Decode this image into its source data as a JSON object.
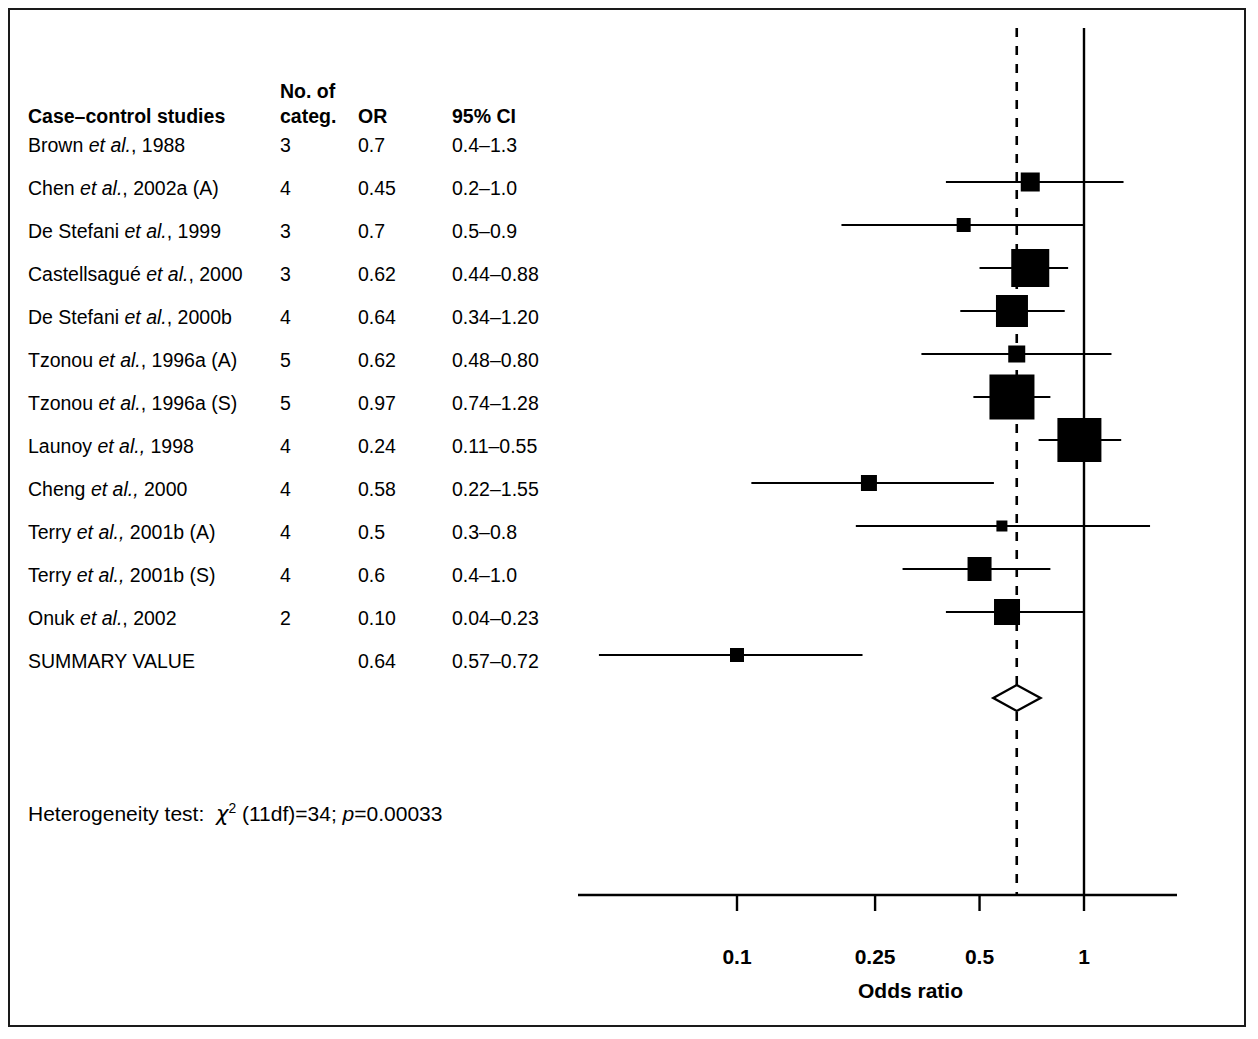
{
  "figure": {
    "table_headers": {
      "study": "Case–control studies",
      "categories_line1": "No. of",
      "categories_line2": "categ.",
      "or": "OR",
      "ci": "95% CI"
    },
    "heterogeneity": {
      "prefix": "Heterogeneity test:",
      "chi": "χ",
      "chi_exp": "2",
      "df": "(11df)=34;",
      "p_italic": "p",
      "p_value": "=0.00033"
    },
    "summary_row_label": "SUMMARY VALUE"
  },
  "chart_data": {
    "type": "forest",
    "title": "",
    "xlabel": "Odds ratio",
    "ylabel": "",
    "xscale": "log",
    "xlim": [
      0.065,
      1.35
    ],
    "xticks": [
      0.1,
      0.25,
      0.5,
      1
    ],
    "xtick_labels": [
      "0.1",
      "0.25",
      "0.5",
      "1"
    ],
    "grid": false,
    "reference_line": 1,
    "summary_line": 0.64,
    "columns": [
      "Case–control studies",
      "No. of categ.",
      "OR",
      "95% CI"
    ],
    "rows": [
      {
        "study": "Brown ",
        "study_italic": "et al.",
        "study_tail": ", 1988",
        "categ": "3",
        "or": "0.7",
        "ci": "0.4–1.3",
        "or_value": 0.7,
        "ci_low": 0.4,
        "ci_high": 1.3,
        "marker_size": 19
      },
      {
        "study": "Chen ",
        "study_italic": "et al.",
        "study_tail": ", 2002a (A)",
        "categ": "4",
        "or": "0.45",
        "ci": "0.2–1.0",
        "or_value": 0.45,
        "ci_low": 0.2,
        "ci_high": 1.0,
        "marker_size": 14
      },
      {
        "study": "De Stefani ",
        "study_italic": "et al.",
        "study_tail": ", 1999",
        "categ": "3",
        "or": "0.7",
        "ci": "0.5–0.9",
        "or_value": 0.7,
        "ci_low": 0.5,
        "ci_high": 0.9,
        "marker_size": 38
      },
      {
        "study": "Castellsagué ",
        "study_italic": "et al.",
        "study_tail": ", 2000",
        "categ": "3",
        "or": "0.62",
        "ci": "0.44–0.88",
        "or_value": 0.62,
        "ci_low": 0.44,
        "ci_high": 0.88,
        "marker_size": 32
      },
      {
        "study": "De Stefani ",
        "study_italic": "et al.",
        "study_tail": ", 2000b",
        "categ": "4",
        "or": "0.64",
        "ci": "0.34–1.20",
        "or_value": 0.64,
        "ci_low": 0.34,
        "ci_high": 1.2,
        "marker_size": 17
      },
      {
        "study": "Tzonou ",
        "study_italic": "et al.",
        "study_tail": ", 1996a (A)",
        "categ": "5",
        "or": "0.62",
        "ci": "0.48–0.80",
        "or_value": 0.62,
        "ci_low": 0.48,
        "ci_high": 0.8,
        "marker_size": 45
      },
      {
        "study": "Tzonou ",
        "study_italic": "et al.",
        "study_tail": ", 1996a (S)",
        "categ": "5",
        "or": "0.97",
        "ci": "0.74–1.28",
        "or_value": 0.97,
        "ci_low": 0.74,
        "ci_high": 1.28,
        "marker_size": 44
      },
      {
        "study": "Launoy ",
        "study_italic": "et al.,",
        "study_tail": " 1998",
        "categ": "4",
        "or": "0.24",
        "ci": "0.11–0.55",
        "or_value": 0.24,
        "ci_low": 0.11,
        "ci_high": 0.55,
        "marker_size": 16
      },
      {
        "study": "Cheng ",
        "study_italic": "et al.,",
        "study_tail": " 2000",
        "categ": "4",
        "or": "0.58",
        "ci": "0.22–1.55",
        "or_value": 0.58,
        "ci_low": 0.22,
        "ci_high": 1.55,
        "marker_size": 11
      },
      {
        "study": "Terry ",
        "study_italic": "et al.,",
        "study_tail": " 2001b (A)",
        "categ": "4",
        "or": "0.5",
        "ci": "0.3–0.8",
        "or_value": 0.5,
        "ci_low": 0.3,
        "ci_high": 0.8,
        "marker_size": 24
      },
      {
        "study": "Terry ",
        "study_italic": "et al.,",
        "study_tail": " 2001b (S)",
        "categ": "4",
        "or": "0.6",
        "ci": "0.4–1.0",
        "or_value": 0.6,
        "ci_low": 0.4,
        "ci_high": 1.0,
        "marker_size": 26
      },
      {
        "study": "Onuk ",
        "study_italic": "et al.",
        "study_tail": ", 2002",
        "categ": "2",
        "or": "0.10",
        "ci": "0.04–0.23",
        "or_value": 0.1,
        "ci_low": 0.04,
        "ci_high": 0.23,
        "marker_size": 14
      }
    ],
    "summary": {
      "study": "SUMMARY VALUE",
      "categ": "",
      "or": "0.64",
      "ci": "0.57–0.72",
      "or_value": 0.64,
      "ci_low": 0.57,
      "ci_high": 0.72
    },
    "annotations": [
      "Heterogeneity test: χ2 (11df)=34; p=0.00033"
    ],
    "colors": {
      "marker": "#000000",
      "line": "#000000",
      "frame": "#1a1a1a",
      "background": "#ffffff"
    }
  }
}
